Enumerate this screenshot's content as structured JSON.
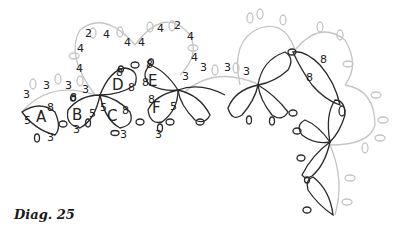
{
  "figure": {
    "caption": "Diag. 25",
    "type": "tatting pattern diagram"
  },
  "colors": {
    "worked_thread": "#2a2a2a",
    "previous_round": "#c4c4c4",
    "background": "#ffffff"
  },
  "rings": [
    {
      "id": "A",
      "label": "A",
      "counts": [
        "5",
        "8",
        "3"
      ]
    },
    {
      "id": "B",
      "label": "B",
      "counts": [
        "8",
        "5",
        "3"
      ]
    },
    {
      "id": "C",
      "label": "C",
      "counts": [
        "5",
        "8",
        "3"
      ]
    },
    {
      "id": "D",
      "label": "D",
      "counts": [
        "8",
        "8"
      ]
    },
    {
      "id": "E",
      "label": "E",
      "counts": [
        "8",
        "8"
      ]
    },
    {
      "id": "F",
      "label": "F",
      "counts": [
        "8",
        "5",
        "3"
      ]
    }
  ],
  "chains": {
    "left_lower": [
      "3",
      "3",
      "3",
      "3"
    ],
    "left_upper": [
      "4",
      "4",
      "2",
      "4",
      "4",
      "4"
    ],
    "right_upper": [
      "4",
      "4",
      "2",
      "4",
      "4",
      "4"
    ],
    "middle": [
      "3",
      "3",
      "3",
      "3"
    ]
  },
  "right_motif_counts": [
    "8",
    "8"
  ]
}
